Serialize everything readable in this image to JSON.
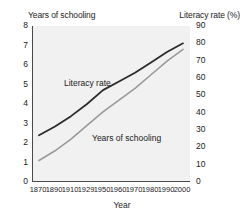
{
  "chart_data": {
    "type": "line",
    "title": "",
    "xlabel": "Year",
    "grid": false,
    "legend_position": "inline-annotation",
    "x": [
      1870,
      1890,
      1910,
      1929,
      1950,
      1960,
      1970,
      1980,
      1990,
      2000
    ],
    "xtick_labels": [
      "1870",
      "1890",
      "1910",
      "1929",
      "1950",
      "1960",
      "1970",
      "1980",
      "1990",
      "2000"
    ],
    "axes": {
      "left": {
        "label": "Years of schooling",
        "ylim": [
          0,
          8
        ],
        "ticks": [
          0,
          1,
          2,
          3,
          4,
          5,
          6,
          7,
          8
        ],
        "tick_labels": [
          "0",
          "1",
          "2",
          "3",
          "4",
          "5",
          "6",
          "7",
          "8"
        ]
      },
      "right": {
        "label": "Literacy rate (%)",
        "ylim": [
          0,
          90
        ],
        "ticks": [
          0,
          10,
          20,
          30,
          40,
          50,
          60,
          70,
          80,
          90
        ],
        "tick_labels": [
          "0",
          "10",
          "20",
          "30",
          "40",
          "50",
          "60",
          "70",
          "80",
          "90"
        ]
      }
    },
    "series": [
      {
        "name": "Literacy rate",
        "axis": "right",
        "unit": "%",
        "color": "#2b2b2b",
        "values": [
          27,
          32,
          38,
          45,
          53,
          58,
          63,
          69,
          75,
          80
        ]
      },
      {
        "name": "Years of schooling",
        "axis": "left",
        "unit": "years",
        "color": "#9a9a9a",
        "values": [
          1.1,
          1.6,
          2.2,
          2.9,
          3.6,
          4.2,
          4.8,
          5.5,
          6.2,
          6.8
        ]
      }
    ],
    "annotations": [
      {
        "text": "Literacy rate",
        "series": "Literacy rate"
      },
      {
        "text": "Years of schooling",
        "series": "Years of schooling"
      }
    ]
  },
  "colors": {
    "plot_background": "#f1f1f1",
    "axis_line": "#4a4a4a",
    "literacy_line": "#2b2b2b",
    "schooling_line": "#9a9a9a",
    "text": "#222222"
  }
}
